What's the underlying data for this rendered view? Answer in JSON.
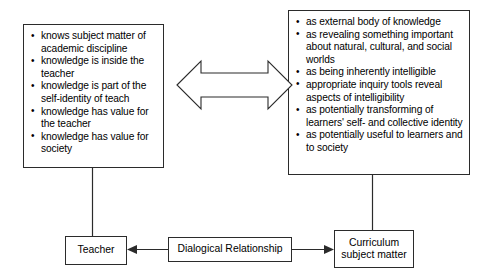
{
  "diagram": {
    "line_color": "#2b2b2b",
    "background": "#ffffff",
    "teacher_knowledge_box": {
      "name": "teacher-knowledge-box",
      "bullets": [
        "knows subject matter of academic discipline",
        "knowledge is inside the teacher",
        "knowledge is part of the self-identity of teach",
        "knowledge has value for the teacher",
        "knowledge has value for society"
      ]
    },
    "curriculum_knowledge_box": {
      "name": "curriculum-knowledge-box",
      "bullets": [
        "as external body of knowledge",
        "as revealing something important about natural, cultural, and social worlds",
        "as being inherently intelligible",
        "appropriate inquiry tools reveal aspects of intelligibility",
        "as potentially transforming of learners' self- and collective identity",
        "as potentially useful to learners and to society"
      ]
    },
    "nodes": {
      "teacher": "Teacher",
      "dialogical_relationship": "Dialogical Relationship",
      "curriculum_subject_matter": "Curriculum\nsubject matter"
    },
    "connectors": {
      "center_arrow": "double-headed-arrow",
      "teacher_drop": "vertical-line",
      "curriculum_drop": "vertical-line",
      "dialogical_to_teacher": "left-arrow",
      "dialogical_to_curriculum": "right-arrow"
    }
  }
}
